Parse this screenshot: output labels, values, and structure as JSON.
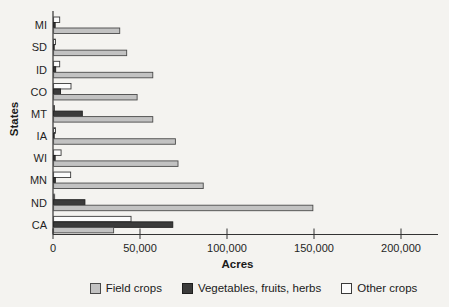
{
  "chart_data": {
    "type": "bar",
    "orientation": "horizontal",
    "title": "",
    "xlabel": "Acres",
    "ylabel": "States",
    "xlim": [
      0,
      220000
    ],
    "xticks": [
      0,
      50000,
      100000,
      150000,
      200000
    ],
    "xtick_labels": [
      "0",
      "50,000",
      "100,000",
      "150,000",
      "200,000"
    ],
    "grid": false,
    "legend_position": "bottom",
    "categories_top_to_bottom": [
      "MI",
      "SD",
      "ID",
      "CO",
      "MT",
      "IA",
      "WI",
      "MN",
      "ND",
      "CA"
    ],
    "bar_order_within_group_top_to_bottom": [
      "Other crops",
      "Vegetables, fruits, herbs",
      "Field crops"
    ],
    "series": [
      {
        "name": "Field crops",
        "color": "#c2c2c2",
        "border": "#4a4a4a",
        "values": [
          38000,
          42000,
          57000,
          48000,
          57000,
          70000,
          71500,
          86000,
          149000,
          34500
        ]
      },
      {
        "name": "Vegetables, fruits, herbs",
        "color": "#3b3b3b",
        "border": "#1e1e1e",
        "values": [
          900,
          300,
          1200,
          4000,
          16500,
          300,
          900,
          1000,
          18000,
          68500
        ]
      },
      {
        "name": "Other crops",
        "color": "#fcfcfc",
        "border": "#3a3a3a",
        "values": [
          3500,
          1100,
          3500,
          10000,
          500,
          1100,
          4300,
          9800,
          600,
          44500
        ]
      }
    ],
    "axis_color": "#333333",
    "text_color": "#1f1f1f"
  }
}
